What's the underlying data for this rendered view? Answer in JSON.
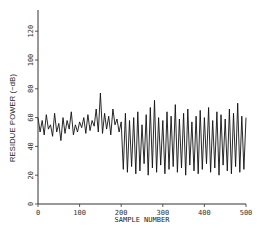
{
  "chart_data": {
    "type": "line",
    "title": "",
    "xlabel": "SAMPLE NUMBER",
    "ylabel": "RESIDUE POWER (−dB)",
    "xlim": [
      0,
      500
    ],
    "ylim": [
      0,
      130
    ],
    "xticks": [
      0,
      100,
      200,
      300,
      400,
      500
    ],
    "yticks": [
      0,
      20,
      40,
      60,
      80,
      100,
      120
    ],
    "grid": false,
    "legend": null,
    "annotations": [],
    "series": [
      {
        "name": "residue power",
        "color": "#111111",
        "x": [
          0,
          5,
          10,
          15,
          20,
          25,
          30,
          35,
          40,
          45,
          50,
          55,
          60,
          65,
          70,
          75,
          80,
          85,
          90,
          95,
          100,
          105,
          110,
          115,
          120,
          125,
          130,
          135,
          140,
          145,
          150,
          155,
          160,
          165,
          170,
          175,
          180,
          185,
          190,
          195,
          200,
          205,
          210,
          215,
          220,
          225,
          230,
          235,
          240,
          245,
          250,
          255,
          260,
          265,
          270,
          275,
          280,
          285,
          290,
          295,
          300,
          305,
          310,
          315,
          320,
          325,
          330,
          335,
          340,
          345,
          350,
          355,
          360,
          365,
          370,
          375,
          380,
          385,
          390,
          395,
          400,
          405,
          410,
          415,
          420,
          425,
          430,
          435,
          440,
          445,
          450,
          455,
          460,
          465,
          470,
          475,
          480,
          485,
          490,
          495,
          500
        ],
        "y": [
          60,
          50,
          58,
          48,
          62,
          52,
          55,
          47,
          63,
          50,
          56,
          44,
          60,
          49,
          58,
          52,
          64,
          48,
          55,
          50,
          57,
          53,
          60,
          49,
          62,
          51,
          58,
          54,
          66,
          50,
          77,
          49,
          63,
          52,
          61,
          48,
          66,
          55,
          59,
          50,
          57,
          24,
          63,
          22,
          58,
          26,
          60,
          21,
          64,
          23,
          55,
          28,
          62,
          20,
          67,
          25,
          72,
          22,
          60,
          27,
          58,
          21,
          64,
          24,
          61,
          26,
          69,
          22,
          59,
          25,
          63,
          20,
          66,
          27,
          57,
          23,
          61,
          21,
          65,
          24,
          60,
          28,
          67,
          22,
          58,
          25,
          64,
          20,
          62,
          27,
          59,
          23,
          66,
          21,
          63,
          26,
          70,
          22,
          61,
          24,
          60
        ]
      }
    ]
  },
  "axes": {
    "y_tick_labels": [
      "0",
      "20",
      "40",
      "60",
      "80",
      "100",
      "120"
    ],
    "x_tick_labels": [
      "0",
      "100",
      "200",
      "300",
      "400",
      "500"
    ],
    "x_title": "SAMPLE NUMBER",
    "y_title": "RESIDUE POWER (−dB)"
  }
}
